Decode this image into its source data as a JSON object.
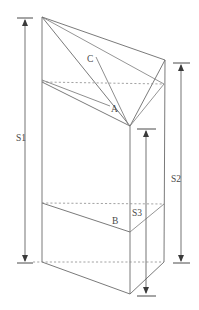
{
  "figure": {
    "type": "line-diagram",
    "background_color": "#ffffff",
    "line_color": "#6b6b6b",
    "hidden_line_color": "#8a8a8a",
    "text_color": "#4a4a4a"
  },
  "dimensions": [
    {
      "id": "s1",
      "label": "S1",
      "side": "left",
      "description": "overall height of prism at left rear edge",
      "label_x": 16,
      "label_y": 141,
      "line_x": 25,
      "top_y": 19,
      "bottom_y": 263,
      "tick_x1": 17,
      "tick_x2": 33
    },
    {
      "id": "s2",
      "label": "S2",
      "side": "right",
      "description": "height of prism at right rear edge",
      "label_x": 172,
      "label_y": 182,
      "line_x": 181,
      "top_y": 64,
      "bottom_y": 263,
      "tick_x1": 173,
      "tick_x2": 190
    },
    {
      "id": "s3",
      "label": "S3",
      "side": "center",
      "description": "height of prism at front vertical edge",
      "label_x": 133,
      "label_y": 215,
      "line_x": 146,
      "top_y": 130,
      "bottom_y": 296,
      "tick_x1": 137,
      "tick_x2": 156
    }
  ],
  "face_labels": [
    {
      "id": "a",
      "label": "A",
      "x": 112,
      "y": 112,
      "description": "upper slanted cut face, leader from top-left vertex region"
    },
    {
      "id": "b",
      "label": "B",
      "x": 112,
      "y": 224,
      "description": "lower slanted cut face on front-left panel"
    },
    {
      "id": "c",
      "label": "C",
      "x": 87,
      "y": 62,
      "description": "top slanted face of the prism"
    }
  ],
  "vertices": {
    "top_left": {
      "x": 42,
      "y": 17
    },
    "top_right": {
      "x": 165,
      "y": 60
    },
    "front_apex": {
      "x": 130,
      "y": 126
    },
    "left_upper_front": {
      "x": 42,
      "y": 82
    },
    "right_upper_back": {
      "x": 164,
      "y": 84
    },
    "left_lower_front": {
      "x": 42,
      "y": 203
    },
    "right_lower_back": {
      "x": 164,
      "y": 204
    },
    "front_mid": {
      "x": 130,
      "y": 232
    },
    "left_bottom": {
      "x": 42,
      "y": 262
    },
    "right_bottom": {
      "x": 164,
      "y": 262
    },
    "front_bottom": {
      "x": 130,
      "y": 294
    }
  }
}
